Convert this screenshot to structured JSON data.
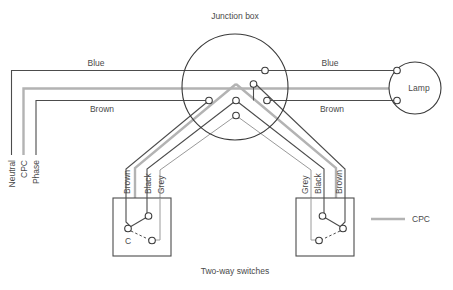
{
  "diagram": {
    "title_label": "Junction box",
    "caption": "Two-way switches",
    "lamp_label": "Lamp",
    "legend": {
      "cpc_label": "CPC"
    },
    "supply_labels": {
      "neutral": "Neutral",
      "cpc": "CPC",
      "phase": "Phase"
    },
    "left_run_labels": {
      "blue": "Blue",
      "brown": "Brown"
    },
    "right_run_labels": {
      "blue": "Blue",
      "brown": "Brown"
    },
    "left_switch_labels": {
      "brown": "Brown",
      "black": "Black",
      "grey": "Grey",
      "common": "C"
    },
    "right_switch_labels": {
      "grey": "Grey",
      "black": "Black",
      "brown": "Brown"
    },
    "colors": {
      "wire": "#4c4c4c",
      "cpc_wire": "#b3b3b3",
      "outline": "#3a3a3a",
      "text": "#4a4a4a",
      "terminal_fill": "#ffffff",
      "background": "#ffffff"
    },
    "geometry": {
      "junction_box": {
        "cx": 235,
        "cy": 87,
        "r": 53
      },
      "lamp": {
        "cx": 415,
        "cy": 88,
        "r": 26
      },
      "left_switch_box": {
        "x": 113,
        "y": 198,
        "w": 58,
        "h": 58
      },
      "right_switch_box": {
        "x": 296,
        "y": 198,
        "w": 58,
        "h": 58
      }
    }
  }
}
